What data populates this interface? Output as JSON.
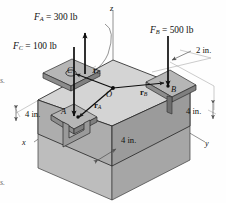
{
  "figure": {
    "kind": "engineering-statics-free-body-diagram"
  },
  "forces": [
    {
      "id": "FA",
      "label_sym": "F",
      "label_sub": "A",
      "equals": "=",
      "value": "300",
      "unit": "lb",
      "text": "F_A = 300 lb",
      "direction": "up"
    },
    {
      "id": "FC",
      "label_sym": "F",
      "label_sub": "C",
      "equals": "=",
      "value": "100",
      "unit": "lb",
      "text": "F_C = 100 lb",
      "direction": "down"
    },
    {
      "id": "FB",
      "label_sym": "F",
      "label_sub": "B",
      "equals": "=",
      "value": "500",
      "unit": "lb",
      "text": "F_B = 500 lb",
      "direction": "down"
    }
  ],
  "position_vectors": [
    {
      "id": "rA",
      "sym": "r",
      "sub": "A"
    },
    {
      "id": "rB",
      "sym": "r",
      "sub": "B"
    },
    {
      "id": "rC",
      "sym": "r",
      "sub": "C"
    }
  ],
  "points": [
    {
      "id": "O",
      "label": "O"
    },
    {
      "id": "A",
      "label": "A"
    },
    {
      "id": "B",
      "label": "B"
    },
    {
      "id": "C",
      "label": "C"
    }
  ],
  "axes": [
    {
      "id": "z",
      "label": "z"
    },
    {
      "id": "x",
      "label": "x"
    },
    {
      "id": "y",
      "label": "y"
    }
  ],
  "dimensions": [
    {
      "id": "dim-2in-top-right",
      "value": "2",
      "unit": "in.",
      "text": "2 in."
    },
    {
      "id": "dim-4in-left",
      "value": "4",
      "unit": "in.",
      "text": "4 in."
    },
    {
      "id": "dim-4in-right",
      "value": "4",
      "unit": "in.",
      "text": "4 in."
    },
    {
      "id": "dim-4in-bottom",
      "value": "4",
      "unit": "in.",
      "text": "4 in."
    }
  ],
  "margin_fragments": [
    {
      "id": "frag-top",
      "text": "s."
    },
    {
      "id": "frag-bottom",
      "text": "s."
    }
  ],
  "colors": {
    "top_face": "#d2d2d2",
    "left_face": "#a8a8a8",
    "right_face": "#9a9a9a",
    "lower_left_face": "#b9b9b9",
    "lower_right_face": "#a3a3a3",
    "pad_top": "#b4b4b4",
    "pad_side": "#8e8e8e",
    "outline": "#2b2b2b",
    "axis_line": "#7d7d7d",
    "arrow": "#0d0d0d",
    "background": "#fefefe"
  }
}
